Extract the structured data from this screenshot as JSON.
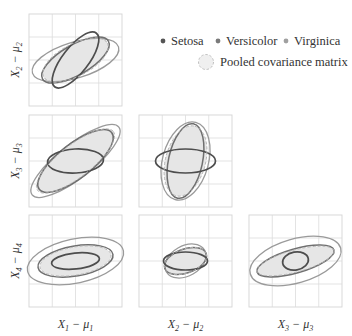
{
  "chart_data": {
    "type": "scatter-matrix-ellipses",
    "title": "",
    "legend": {
      "position": "top-right",
      "entries": [
        {
          "label": "Setosa",
          "color": "#555555",
          "marker": "dot"
        },
        {
          "label": "Versicolor",
          "color": "#7a7a7a",
          "marker": "dot"
        },
        {
          "label": "Virginica",
          "color": "#a0a0a0",
          "marker": "dot"
        },
        {
          "label": "Pooled covariance matrix",
          "color": "#bdbdbd",
          "marker": "dashed-circle-filled"
        }
      ]
    },
    "row_labels": [
      {
        "main": "X",
        "sub1": "2",
        "minus": " − ",
        "mu": "μ",
        "sub2": "2"
      },
      {
        "main": "X",
        "sub1": "3",
        "minus": " − ",
        "mu": "μ",
        "sub2": "3"
      },
      {
        "main": "X",
        "sub1": "4",
        "minus": " − ",
        "mu": "μ",
        "sub2": "4"
      }
    ],
    "col_labels": [
      {
        "main": "X",
        "sub1": "1",
        "minus": " − ",
        "mu": "μ",
        "sub2": "1"
      },
      {
        "main": "X",
        "sub1": "2",
        "minus": " − ",
        "mu": "μ",
        "sub2": "2"
      },
      {
        "main": "X",
        "sub1": "3",
        "minus": " − ",
        "mu": "μ",
        "sub2": "3"
      }
    ],
    "grid": true,
    "grid_divisions": 4,
    "panels": [
      {
        "row": 1,
        "col": 1,
        "y": "X2-mu2",
        "x": "X1-mu1",
        "ellipses": {
          "pooled": {
            "rx": 36,
            "ry": 16,
            "rot": -28
          },
          "setosa": {
            "rx": 34,
            "ry": 13,
            "rot": -52
          },
          "versicolor": {
            "rx": 38,
            "ry": 15,
            "rot": -30
          },
          "virginica": {
            "rx": 45,
            "ry": 18,
            "rot": -17
          }
        }
      },
      {
        "row": 2,
        "col": 1,
        "y": "X3-mu3",
        "x": "X1-mu1",
        "ellipses": {
          "pooled": {
            "rx": 48,
            "ry": 16,
            "rot": -38
          },
          "setosa": {
            "rx": 28,
            "ry": 12,
            "rot": -3
          },
          "versicolor": {
            "rx": 46,
            "ry": 17,
            "rot": -38
          },
          "virginica": {
            "rx": 55,
            "ry": 17,
            "rot": -38
          }
        }
      },
      {
        "row": 2,
        "col": 2,
        "y": "X3-mu3",
        "x": "X2-mu2",
        "ellipses": {
          "pooled": {
            "rx": 36,
            "ry": 20,
            "rot": -75
          },
          "setosa": {
            "rx": 30,
            "ry": 12,
            "rot": 0
          },
          "versicolor": {
            "rx": 38,
            "ry": 17,
            "rot": -78
          },
          "virginica": {
            "rx": 40,
            "ry": 23,
            "rot": -75
          }
        }
      },
      {
        "row": 3,
        "col": 1,
        "y": "X4-mu4",
        "x": "X1-mu1",
        "ellipses": {
          "pooled": {
            "rx": 36,
            "ry": 14,
            "rot": -10
          },
          "setosa": {
            "rx": 24,
            "ry": 8,
            "rot": -6
          },
          "versicolor": {
            "rx": 38,
            "ry": 15,
            "rot": -10
          },
          "virginica": {
            "rx": 49,
            "ry": 22,
            "rot": -12
          }
        }
      },
      {
        "row": 3,
        "col": 2,
        "y": "X4-mu4",
        "x": "X2-mu2",
        "ellipses": {
          "pooled": {
            "rx": 22,
            "ry": 12,
            "rot": -20
          },
          "setosa": {
            "rx": 22,
            "ry": 9,
            "rot": 0
          },
          "versicolor": {
            "rx": 22,
            "ry": 12,
            "rot": -20
          },
          "virginica": {
            "rx": 22,
            "ry": 15,
            "rot": -30
          }
        }
      },
      {
        "row": 3,
        "col": 3,
        "y": "X4-mu4",
        "x": "X3-mu3",
        "ellipses": {
          "pooled": {
            "rx": 40,
            "ry": 11,
            "rot": -15
          },
          "setosa": {
            "rx": 13,
            "ry": 9,
            "rot": -10
          },
          "versicolor": {
            "rx": 40,
            "ry": 12,
            "rot": -16
          },
          "virginica": {
            "rx": 47,
            "ry": 22,
            "rot": -16
          }
        }
      }
    ]
  },
  "colors": {
    "setosa": "#4d4d4d",
    "versicolor": "#6f6f6f",
    "virginica": "#9a9a9a",
    "pooled_fill": "#e6e6e6",
    "pooled_stroke": "#b5b5b5",
    "grid": "#dcdcdc"
  }
}
